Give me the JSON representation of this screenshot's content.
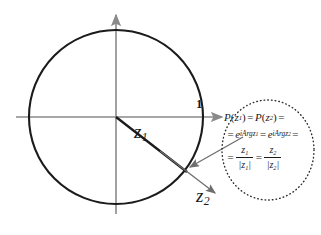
{
  "figure": {
    "colors": {
      "axis": "#8a8a8a",
      "circle": "#1b1b1b",
      "ray_primary": "#1b1b1b",
      "ray_secondary": "#6e6e6e",
      "callout_border": "#2b2b2b",
      "text": "#1b1b1b",
      "background": "#ffffff"
    }
  },
  "labels": {
    "z1": "z",
    "z1_sub": "1",
    "z2": "z",
    "z2_sub": "2",
    "unit_mark": "1"
  },
  "callout": {
    "line1": {
      "p": "P",
      "open1": "(",
      "z_a": "z",
      "sub_a": "1",
      "close1": ")",
      "eq1": "=",
      "p2": "P",
      "open2": "(",
      "z_b": "z",
      "sub_b": "2",
      "close2": ")",
      "eq2": "="
    },
    "line2": {
      "eq0": "=",
      "e1": "e",
      "exp1": "iArg",
      "exp1_sub": "1",
      "exp1_z": "z",
      "eq1": "=",
      "e2": "e",
      "exp2": "iArg",
      "exp2_sub": "2",
      "exp2_z": "z",
      "eq2": "="
    },
    "line3": {
      "eq0": "=",
      "num1": "z",
      "num1_sub": "1",
      "den1_open": "|",
      "den1": "z",
      "den1_sub": "1",
      "den1_close": "|",
      "eq1": "=",
      "num2": "z",
      "num2_sub": "2",
      "den2_open": "|",
      "den2": "z",
      "den2_sub": "2",
      "den2_close": "|"
    }
  }
}
